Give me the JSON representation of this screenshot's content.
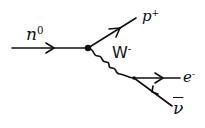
{
  "diagram": {
    "type": "feynman-diagram",
    "process": "beta-minus decay",
    "particles": {
      "neutron": {
        "label": "n",
        "charge": "0"
      },
      "proton": {
        "label": "p",
        "charge": "+"
      },
      "w_boson": {
        "label": "W",
        "charge": "-"
      },
      "electron": {
        "label": "e",
        "charge": "-"
      },
      "antineutrino": {
        "label": "ν",
        "bar": true
      }
    },
    "vertices": [
      {
        "id": "v1",
        "x": 88,
        "y": 48,
        "connects": [
          "neutron",
          "proton",
          "w_boson"
        ]
      },
      {
        "id": "v2",
        "x": 134,
        "y": 78,
        "connects": [
          "w_boson",
          "electron",
          "antineutrino"
        ]
      }
    ],
    "edges": [
      {
        "particle": "neutron",
        "from": [
          12,
          48
        ],
        "to": [
          88,
          48
        ],
        "style": "fermion",
        "arrow": "forward"
      },
      {
        "particle": "proton",
        "from": [
          88,
          48
        ],
        "to": [
          136,
          18
        ],
        "style": "fermion",
        "arrow": "forward"
      },
      {
        "particle": "w_boson",
        "from": [
          88,
          48
        ],
        "to": [
          134,
          78
        ],
        "style": "wavy"
      },
      {
        "particle": "electron",
        "from": [
          134,
          78
        ],
        "to": [
          180,
          78
        ],
        "style": "fermion",
        "arrow": "forward"
      },
      {
        "particle": "antineutrino",
        "from": [
          134,
          78
        ],
        "to": [
          172,
          106
        ],
        "style": "fermion",
        "arrow": "backward"
      }
    ],
    "line_color": "#111111"
  }
}
